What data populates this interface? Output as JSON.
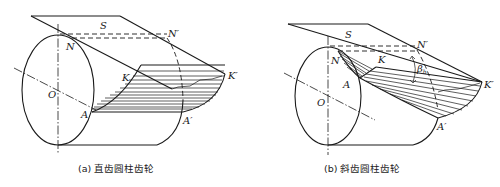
{
  "figure": {
    "panel_a": {
      "caption": "(a) 直齿圆柱齿轮",
      "labels": {
        "S": "S",
        "N": "N",
        "N_prime": "N′",
        "K": "K",
        "K_prime": "K′",
        "O": "O",
        "A": "A",
        "A_prime": "A′"
      }
    },
    "panel_b": {
      "caption": "(b) 斜齿圆柱齿轮",
      "labels": {
        "S": "S",
        "N": "N",
        "N_prime": "N′",
        "K": "K",
        "K_prime": "K′",
        "O": "O",
        "A": "A",
        "A_prime": "A′",
        "beta": "β",
        "beta_sub": "b"
      }
    },
    "colors": {
      "line": "#1a1a1a",
      "background": "#ffffff"
    }
  }
}
